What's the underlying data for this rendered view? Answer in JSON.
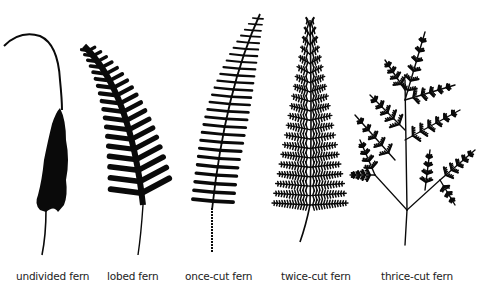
{
  "figure": {
    "ink_color": "#0a0a0a",
    "background": "#ffffff",
    "ferns": [
      {
        "id": "undivided",
        "label": "undivided fern",
        "division": "undivided"
      },
      {
        "id": "lobed",
        "label": "lobed fern",
        "division": "lobed"
      },
      {
        "id": "once-cut",
        "label": "once-cut fern",
        "division": "once-cut"
      },
      {
        "id": "twice-cut",
        "label": "twice-cut fern",
        "division": "twice-cut"
      },
      {
        "id": "thrice-cut",
        "label": "thrice-cut fern",
        "division": "thrice-cut"
      }
    ]
  }
}
